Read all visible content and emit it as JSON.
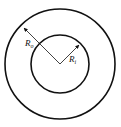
{
  "diagram": {
    "type": "concentric-circles",
    "center": [
      60,
      64
    ],
    "outer_circle": {
      "radius": 55,
      "label": "R",
      "label_sub": "o"
    },
    "inner_circle": {
      "radius": 29,
      "label": "R",
      "label_sub": "i"
    },
    "stroke_color": "#111111",
    "background": "#ffffff"
  }
}
